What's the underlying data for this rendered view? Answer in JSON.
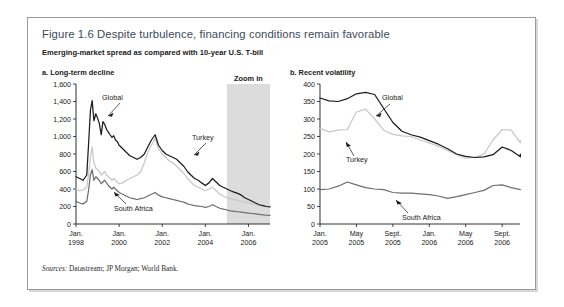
{
  "figure": {
    "title": "Figure 1.6  Despite turbulence, financing conditions remain favorable",
    "subtitle": "Emerging-market spread as compared with 10-year U.S. T-bill",
    "sources_label": "Sources:",
    "sources_text": " Datastream; JP Morgan; World Bank."
  },
  "legend_labels": {
    "global": "Global",
    "turkey": "Turkey",
    "south_africa": "South Africa"
  },
  "annotations": {
    "zoom_in": "Zoom in"
  },
  "colors": {
    "global": "#1c1c1c",
    "turkey": "#c7c7c7",
    "south_africa": "#6e6e6e",
    "zoom_band": "#dcdcdc",
    "title": "#3d4b58",
    "border": "#9a9a9a"
  },
  "chart_data": [
    {
      "type": "line",
      "panel_id": "a",
      "title": "a. Long-term decline",
      "xlabel": "",
      "ylabel": "",
      "ylim": [
        0,
        1600
      ],
      "yticks": [
        0,
        200,
        400,
        600,
        800,
        1000,
        1200,
        1400,
        1600
      ],
      "ytick_labels": [
        "0",
        "200",
        "400",
        "600",
        "800",
        "1,000",
        "1,200",
        "1,400",
        "1,600"
      ],
      "xtick_labels": [
        "Jan.\n1998",
        "Jan.\n2000",
        "Jan.\n2002",
        "Jan.\n2004",
        "Jan.\n2006"
      ],
      "xticks_top": [
        "Jan.",
        "Jan.",
        "Jan.",
        "Jan.",
        "Jan."
      ],
      "xticks_bottom": [
        "1998",
        "2000",
        "2002",
        "2004",
        "2006"
      ],
      "x_range": [
        1998.0,
        2007.0
      ],
      "grid": false,
      "legend_position": "inline-annotation",
      "annotation_band": {
        "label": "Zoom in",
        "x_start": 2005.0,
        "x_end": 2007.0
      },
      "series": [
        {
          "name": "Global",
          "color": "#1c1c1c",
          "x": [
            1998.0,
            1998.17,
            1998.33,
            1998.5,
            1998.58,
            1998.67,
            1998.75,
            1998.83,
            1998.92,
            1999.0,
            1999.08,
            1999.17,
            1999.25,
            1999.33,
            1999.42,
            1999.5,
            1999.58,
            1999.67,
            1999.75,
            1999.83,
            1999.92,
            2000.0,
            2000.17,
            2000.33,
            2000.5,
            2000.67,
            2000.83,
            2001.0,
            2001.17,
            2001.33,
            2001.5,
            2001.67,
            2001.83,
            2002.0,
            2002.17,
            2002.33,
            2002.5,
            2002.67,
            2002.83,
            2003.0,
            2003.17,
            2003.33,
            2003.5,
            2003.67,
            2003.83,
            2004.0,
            2004.17,
            2004.33,
            2004.5,
            2004.67,
            2004.83,
            2005.0,
            2005.17,
            2005.33,
            2005.5,
            2005.67,
            2005.83,
            2006.0,
            2006.17,
            2006.33,
            2006.5,
            2006.67,
            2006.83,
            2007.0
          ],
          "values": [
            540,
            520,
            500,
            560,
            900,
            1300,
            1410,
            1180,
            1260,
            1210,
            1150,
            1020,
            1170,
            1140,
            1080,
            1050,
            1020,
            990,
            1010,
            960,
            940,
            900,
            860,
            820,
            780,
            760,
            740,
            760,
            800,
            880,
            960,
            1020,
            900,
            840,
            800,
            780,
            760,
            740,
            700,
            660,
            600,
            560,
            520,
            500,
            470,
            440,
            470,
            520,
            480,
            440,
            420,
            400,
            380,
            365,
            350,
            330,
            300,
            280,
            260,
            240,
            220,
            210,
            200,
            195
          ]
        },
        {
          "name": "Turkey",
          "color": "#c7c7c7",
          "x": [
            1998.0,
            1998.17,
            1998.33,
            1998.5,
            1998.58,
            1998.67,
            1998.75,
            1998.83,
            1998.92,
            1999.0,
            1999.08,
            1999.17,
            1999.25,
            1999.33,
            1999.42,
            1999.5,
            1999.58,
            1999.67,
            1999.75,
            1999.83,
            1999.92,
            2000.0,
            2000.17,
            2000.33,
            2000.5,
            2000.67,
            2000.83,
            2001.0,
            2001.17,
            2001.33,
            2001.5,
            2001.67,
            2001.83,
            2002.0,
            2002.17,
            2002.33,
            2002.5,
            2002.67,
            2002.83,
            2003.0,
            2003.17,
            2003.33,
            2003.5,
            2003.67,
            2003.83,
            2004.0,
            2004.17,
            2004.33,
            2004.5,
            2004.67,
            2004.83,
            2005.0,
            2005.17,
            2005.33,
            2005.5,
            2005.67,
            2005.83,
            2006.0,
            2006.17,
            2006.33,
            2006.5,
            2006.67,
            2006.83,
            2007.0
          ],
          "values": [
            400,
            380,
            390,
            420,
            560,
            760,
            880,
            700,
            640,
            620,
            600,
            560,
            580,
            600,
            560,
            540,
            520,
            500,
            520,
            500,
            480,
            460,
            470,
            500,
            520,
            540,
            560,
            600,
            700,
            820,
            900,
            980,
            860,
            800,
            760,
            720,
            700,
            660,
            620,
            580,
            520,
            480,
            440,
            420,
            400,
            380,
            400,
            420,
            380,
            340,
            320,
            300,
            290,
            280,
            270,
            260,
            250,
            240,
            230,
            220,
            215,
            210,
            205,
            200
          ]
        },
        {
          "name": "South Africa",
          "color": "#6e6e6e",
          "x": [
            1998.0,
            1998.17,
            1998.33,
            1998.5,
            1998.58,
            1998.67,
            1998.75,
            1998.83,
            1998.92,
            1999.0,
            1999.08,
            1999.17,
            1999.25,
            1999.33,
            1999.42,
            1999.5,
            1999.58,
            1999.67,
            1999.75,
            1999.83,
            1999.92,
            2000.0,
            2000.17,
            2000.33,
            2000.5,
            2000.67,
            2000.83,
            2001.0,
            2001.17,
            2001.33,
            2001.5,
            2001.67,
            2001.83,
            2002.0,
            2002.17,
            2002.33,
            2002.5,
            2002.67,
            2002.83,
            2003.0,
            2003.17,
            2003.33,
            2003.5,
            2003.67,
            2003.83,
            2004.0,
            2004.17,
            2004.33,
            2004.5,
            2004.67,
            2004.83,
            2005.0,
            2005.17,
            2005.33,
            2005.5,
            2005.67,
            2005.83,
            2006.0,
            2006.17,
            2006.33,
            2006.5,
            2006.67,
            2006.83,
            2007.0
          ],
          "values": [
            260,
            240,
            230,
            260,
            380,
            560,
            620,
            500,
            540,
            520,
            500,
            460,
            480,
            500,
            470,
            440,
            420,
            400,
            420,
            400,
            380,
            360,
            340,
            320,
            300,
            290,
            280,
            290,
            300,
            320,
            340,
            360,
            330,
            310,
            300,
            290,
            280,
            270,
            260,
            250,
            230,
            220,
            210,
            205,
            200,
            190,
            200,
            220,
            200,
            180,
            170,
            160,
            150,
            145,
            140,
            135,
            130,
            125,
            120,
            115,
            110,
            105,
            100,
            98
          ]
        }
      ]
    },
    {
      "type": "line",
      "panel_id": "b",
      "title": "b. Recent volatility",
      "xlabel": "",
      "ylabel": "",
      "ylim": [
        0,
        400
      ],
      "yticks": [
        0,
        50,
        100,
        150,
        200,
        250,
        300,
        350,
        400
      ],
      "ytick_labels": [
        "0",
        "50",
        "100",
        "150",
        "200",
        "250",
        "300",
        "350",
        "400"
      ],
      "xticks_top": [
        "Jan.",
        "May",
        "Sept.",
        "Jan.",
        "May",
        "Sept."
      ],
      "xticks_bottom": [
        "2005",
        "2005",
        "2005",
        "2006",
        "2006",
        "2006"
      ],
      "x_range": [
        2005.0,
        2006.83
      ],
      "grid": false,
      "legend_position": "inline-annotation",
      "series": [
        {
          "name": "Global",
          "color": "#1c1c1c",
          "x": [
            2005.0,
            2005.083,
            2005.167,
            2005.25,
            2005.333,
            2005.417,
            2005.5,
            2005.583,
            2005.667,
            2005.75,
            2005.833,
            2005.917,
            2006.0,
            2006.083,
            2006.167,
            2006.25,
            2006.333,
            2006.417,
            2006.5,
            2006.583,
            2006.667,
            2006.75,
            2006.833
          ],
          "values": [
            360,
            352,
            350,
            358,
            372,
            376,
            370,
            330,
            290,
            265,
            255,
            248,
            238,
            228,
            215,
            200,
            193,
            190,
            192,
            198,
            220,
            210,
            192,
            200
          ]
        },
        {
          "name": "Turkey",
          "color": "#c7c7c7",
          "x": [
            2005.0,
            2005.083,
            2005.167,
            2005.25,
            2005.333,
            2005.417,
            2005.5,
            2005.583,
            2005.667,
            2005.75,
            2005.833,
            2005.917,
            2006.0,
            2006.083,
            2006.167,
            2006.25,
            2006.333,
            2006.417,
            2006.5,
            2006.583,
            2006.667,
            2006.75,
            2006.833
          ],
          "values": [
            273,
            263,
            268,
            270,
            320,
            328,
            300,
            268,
            256,
            252,
            250,
            240,
            232,
            222,
            210,
            198,
            188,
            190,
            200,
            240,
            270,
            268,
            232,
            238
          ]
        },
        {
          "name": "South Africa",
          "color": "#6e6e6e",
          "x": [
            2005.0,
            2005.083,
            2005.167,
            2005.25,
            2005.333,
            2005.417,
            2005.5,
            2005.583,
            2005.667,
            2005.75,
            2005.833,
            2005.917,
            2006.0,
            2006.083,
            2006.167,
            2006.25,
            2006.333,
            2006.417,
            2006.5,
            2006.583,
            2006.667,
            2006.75,
            2006.833
          ],
          "values": [
            98,
            100,
            108,
            120,
            112,
            104,
            100,
            98,
            90,
            88,
            88,
            86,
            84,
            80,
            73,
            78,
            84,
            90,
            96,
            110,
            112,
            104,
            98,
            98
          ]
        }
      ]
    }
  ]
}
